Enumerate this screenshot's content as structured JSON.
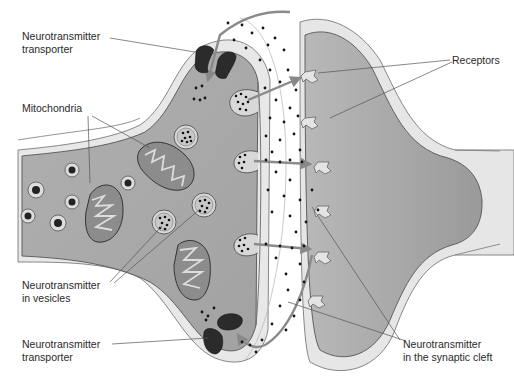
{
  "diagram": {
    "type": "biology-illustration",
    "labels": [
      {
        "id": "transporter_top",
        "line1": "Neurotransmitter",
        "line2": "transporter"
      },
      {
        "id": "mitochondria",
        "line1": "Mitochondria"
      },
      {
        "id": "vesicles",
        "line1": "Neurotransmitter",
        "line2": "in vesicles"
      },
      {
        "id": "transporter_bottom",
        "line1": "Neurotransmitter",
        "line2": "transporter"
      },
      {
        "id": "receptors",
        "line1": "Receptors"
      },
      {
        "id": "cleft",
        "line1": "Neurotransmitter",
        "line2": "in the synaptic cleft"
      }
    ],
    "colors": {
      "cytoplasm": "#a9a9a9",
      "membrane_outer": "#e6e6e6",
      "membrane_line": "#6b6b6b",
      "transporter": "#2b2b2b",
      "neurotransmitter_dot": "#151515",
      "arrow": "#8a8a8a",
      "postsynaptic": "#a3a3a3",
      "leader_line": "#555555"
    }
  }
}
